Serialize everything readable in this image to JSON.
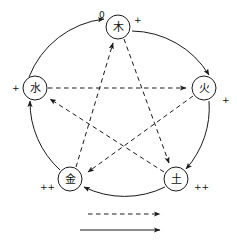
{
  "diagram": {
    "nodes": [
      {
        "id": "wood",
        "glyph": "木",
        "cx": 118,
        "cy": 27,
        "r": 12,
        "sign": "+",
        "sign_x": 134,
        "sign_y": 20
      },
      {
        "id": "fire",
        "glyph": "火",
        "cx": 204,
        "cy": 88,
        "r": 12,
        "sign": "+",
        "sign_x": 222,
        "sign_y": 100
      },
      {
        "id": "earth",
        "glyph": "土",
        "cx": 176,
        "cy": 179,
        "r": 12,
        "sign": "++",
        "sign_x": 194,
        "sign_y": 187
      },
      {
        "id": "metal",
        "glyph": "金",
        "cx": 70,
        "cy": 179,
        "r": 12,
        "sign": "++",
        "sign_x": 40,
        "sign_y": 187
      },
      {
        "id": "water",
        "glyph": "水",
        "cx": 35,
        "cy": 88,
        "r": 12,
        "sign": "+",
        "sign_x": 12,
        "sign_y": 88
      }
    ],
    "zero_label": {
      "text": "0",
      "x": 99,
      "y": 15
    },
    "generating_cycle": [
      {
        "id": "water-to-wood",
        "from": "water",
        "to": "wood"
      },
      {
        "id": "wood-to-fire",
        "from": "wood",
        "to": "fire"
      },
      {
        "id": "fire-to-earth",
        "from": "fire",
        "to": "earth"
      },
      {
        "id": "earth-to-metal",
        "from": "earth",
        "to": "metal"
      },
      {
        "id": "metal-to-water",
        "from": "metal",
        "to": "water"
      }
    ],
    "overcoming_cycle": [
      {
        "id": "water-to-fire",
        "from": "water",
        "to": "fire"
      },
      {
        "id": "fire-to-metal",
        "from": "fire",
        "to": "metal"
      },
      {
        "id": "metal-to-wood",
        "from": "metal",
        "to": "wood"
      },
      {
        "id": "wood-to-earth",
        "from": "wood",
        "to": "earth"
      },
      {
        "id": "earth-to-water",
        "from": "earth",
        "to": "water"
      }
    ],
    "legend": {
      "dashed": {
        "label": "",
        "x1": 88,
        "x2": 168,
        "y": 214
      },
      "solid": {
        "label": "",
        "x1": 80,
        "x2": 168,
        "y": 230
      }
    }
  }
}
